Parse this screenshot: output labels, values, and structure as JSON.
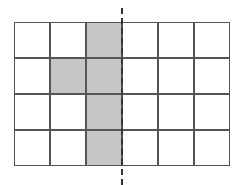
{
  "grid": {
    "rows": 4,
    "cols": 6,
    "cell_size": 36,
    "shaded_cells": [
      [
        0,
        2
      ],
      [
        1,
        1
      ],
      [
        1,
        2
      ],
      [
        2,
        2
      ],
      [
        3,
        2
      ]
    ],
    "shade_color": "#c6c6c6",
    "line_color": "#555555"
  },
  "symmetry_line": {
    "style": "dashed",
    "position": "right edge of column 3",
    "color": "#333333"
  }
}
